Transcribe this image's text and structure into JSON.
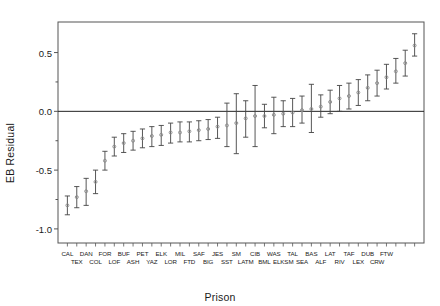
{
  "chart_data": {
    "type": "scatter",
    "title": "",
    "xlabel": "Prison",
    "ylabel": "EB Residual",
    "ylim": [
      -1.12,
      0.76
    ],
    "yticks": [
      0.5,
      0.0,
      -0.5,
      -1.0
    ],
    "ytick_labels": [
      "0.5",
      "0.0",
      "-0.5",
      "-1.0"
    ],
    "yminor": [
      0.25,
      -0.25,
      -0.75
    ],
    "grid": false,
    "legend": null,
    "reference_line_y": 0.0,
    "n_points": 34,
    "categories": [
      "CAL",
      "TEX",
      "DAN",
      "COL",
      "FOR",
      "LOF",
      "BUF",
      "ASH",
      "PET",
      "YAZ",
      "ELK",
      "LOR",
      "MIL",
      "FTD",
      "SAF",
      "BIG",
      "JES",
      "SST",
      "SM",
      "LATM",
      "CIB",
      "BML",
      "WAS",
      "ELKSM",
      "TAL",
      "SEA",
      "BAS",
      "ALF",
      "LAT",
      "RIV",
      "TAF",
      "LEX",
      "DUB",
      "CRW",
      "FTW"
    ],
    "series": [
      {
        "name": "EB Residual",
        "point_estimates": [
          -0.8,
          -0.73,
          -0.68,
          -0.6,
          -0.42,
          -0.3,
          -0.27,
          -0.25,
          -0.23,
          -0.21,
          -0.2,
          -0.18,
          -0.18,
          -0.17,
          -0.16,
          -0.15,
          -0.13,
          -0.12,
          -0.1,
          -0.06,
          -0.04,
          -0.04,
          -0.03,
          -0.02,
          -0.01,
          0.01,
          0.02,
          0.04,
          0.08,
          0.11,
          0.13,
          0.16,
          0.2,
          0.24,
          0.29,
          0.34,
          0.41,
          0.56
        ],
        "lower": [
          -0.88,
          -0.82,
          -0.8,
          -0.7,
          -0.5,
          -0.38,
          -0.35,
          -0.33,
          -0.31,
          -0.3,
          -0.29,
          -0.27,
          -0.26,
          -0.26,
          -0.25,
          -0.24,
          -0.23,
          -0.3,
          -0.36,
          -0.22,
          -0.3,
          -0.14,
          -0.19,
          -0.13,
          -0.13,
          -0.1,
          -0.18,
          -0.05,
          -0.02,
          0.0,
          0.02,
          0.05,
          0.09,
          0.13,
          0.19,
          0.24,
          0.3,
          0.47
        ],
        "upper": [
          -0.72,
          -0.64,
          -0.57,
          -0.5,
          -0.34,
          -0.22,
          -0.19,
          -0.17,
          -0.15,
          -0.13,
          -0.12,
          -0.1,
          -0.09,
          -0.09,
          -0.08,
          -0.07,
          -0.05,
          0.07,
          0.15,
          0.09,
          0.22,
          0.06,
          0.12,
          0.09,
          0.11,
          0.13,
          0.23,
          0.14,
          0.18,
          0.22,
          0.24,
          0.27,
          0.31,
          0.35,
          0.4,
          0.45,
          0.52,
          0.66
        ]
      }
    ],
    "xlabels_row_top": [
      "CAL",
      "DAN",
      "FOR",
      "BUF",
      "PET",
      "ELK",
      "MIL",
      "SAF",
      "JES",
      "CIB",
      "WAS",
      "TAL",
      "BAS",
      "LAT",
      "TAF",
      "DUB",
      "CRW"
    ],
    "xlabels_row_bottom": [
      "TEX",
      "COL",
      "LOF",
      "ASH",
      "YAZ",
      "LOR",
      "FTD",
      "BIG",
      "SM",
      "SST",
      "LATM",
      "BML",
      "ELKSM",
      "SEA",
      "ALF",
      "RIV",
      "LEX",
      "FTW"
    ]
  },
  "style": {
    "frame_color": "#555555",
    "marker_color": "#888888",
    "whisker_color": "#444444",
    "ref_line_color": "#222222",
    "text_color": "#1a1a1a"
  }
}
